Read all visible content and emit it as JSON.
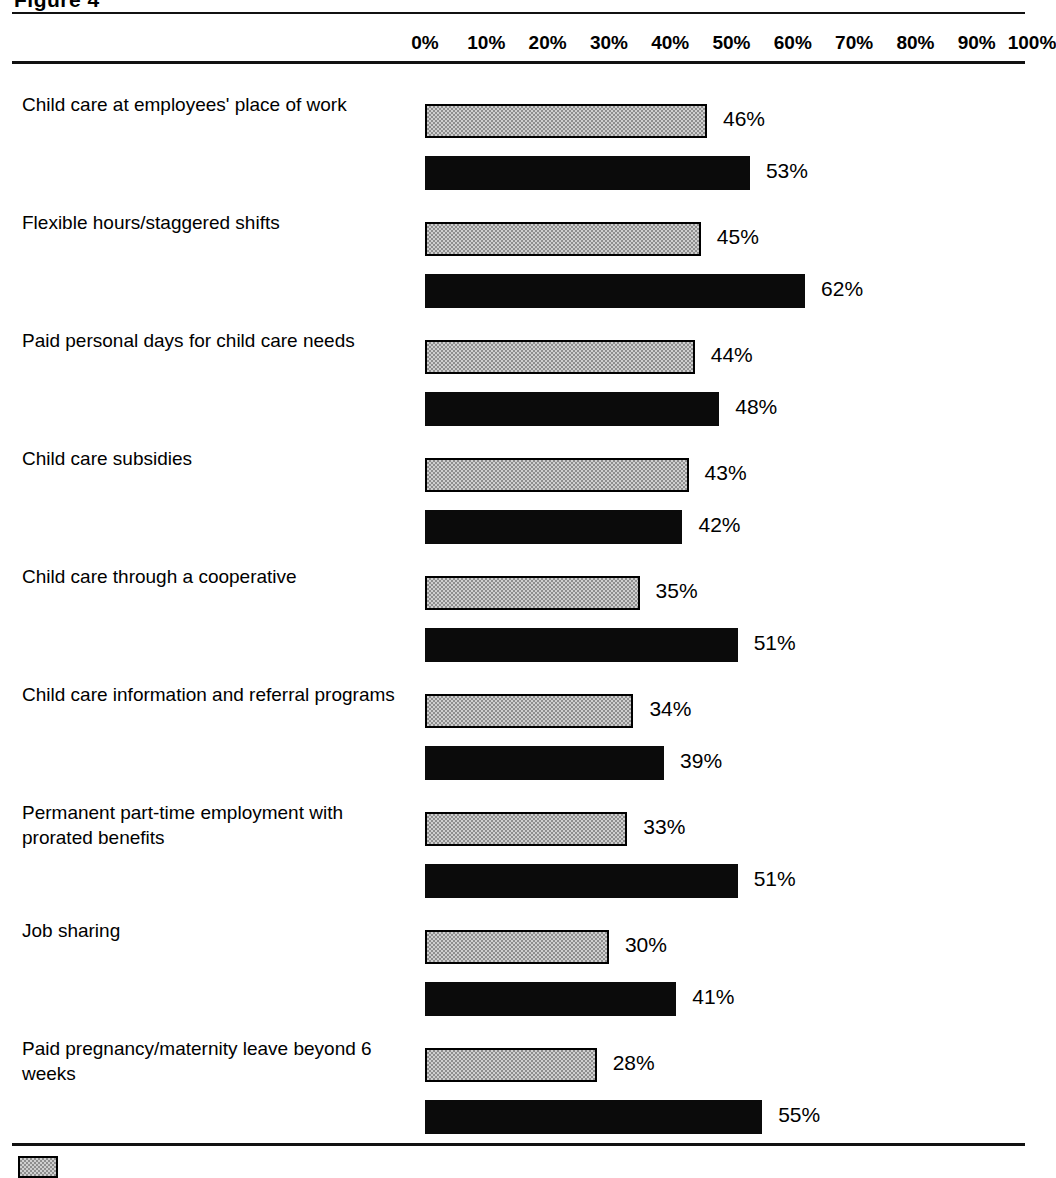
{
  "figure": {
    "title": "Figure 4"
  },
  "axis": {
    "ticks": [
      "0%",
      "10%",
      "20%",
      "30%",
      "40%",
      "50%",
      "60%",
      "70%",
      "80%",
      "90%",
      "100%"
    ]
  },
  "legend": {
    "items": [
      {
        "label": "",
        "style": "light"
      }
    ]
  },
  "colors": {
    "light_bar_fill": "#cfcfcf",
    "light_bar_border": "#000000",
    "dark_bar_fill": "#0b0b0b",
    "rule": "#111111",
    "text": "#000000",
    "background": "#ffffff"
  },
  "chart_data": {
    "type": "bar",
    "orientation": "horizontal",
    "title": "Figure 4",
    "xlabel": "",
    "ylabel": "",
    "xlim": [
      0,
      100
    ],
    "grid": false,
    "legend_position": "bottom-left",
    "tick_labels": [
      "0%",
      "10%",
      "20%",
      "30%",
      "40%",
      "50%",
      "60%",
      "70%",
      "80%",
      "90%",
      "100%"
    ],
    "categories": [
      "Child care at employees' place of work",
      "Flexible hours/staggered shifts",
      "Paid personal days for child care needs",
      "Child care subsidies",
      "Child care through a cooperative",
      "Child care information and referral programs",
      "Permanent part-time employment with prorated benefits",
      "Job sharing",
      "Paid pregnancy/maternity leave beyond 6 weeks"
    ],
    "series": [
      {
        "name": "light",
        "style": "light",
        "values": [
          46,
          45,
          44,
          43,
          35,
          34,
          33,
          30,
          28
        ],
        "value_labels": [
          "46%",
          "45%",
          "44%",
          "43%",
          "35%",
          "34%",
          "33%",
          "30%",
          "28%"
        ]
      },
      {
        "name": "dark",
        "style": "dark",
        "values": [
          53,
          62,
          48,
          42,
          51,
          39,
          51,
          41,
          55
        ],
        "value_labels": [
          "53%",
          "62%",
          "48%",
          "42%",
          "51%",
          "39%",
          "51%",
          "41%",
          "55%"
        ]
      }
    ]
  }
}
